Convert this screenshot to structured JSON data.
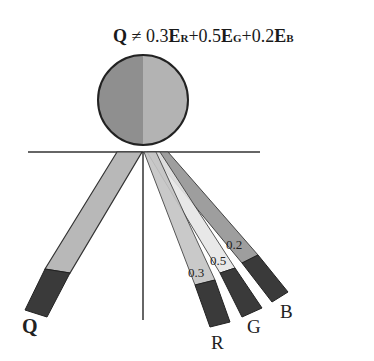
{
  "formula": {
    "lhs": "Q",
    "relation": "≠",
    "terms": [
      {
        "coef": "0.3",
        "symbol": "E",
        "subscript": "R"
      },
      {
        "coef": "0.5",
        "symbol": "E",
        "subscript": "G"
      },
      {
        "coef": "0.2",
        "symbol": "E",
        "subscript": "B"
      }
    ],
    "plus": "+"
  },
  "colors": {
    "circle_left": "#8f8f8f",
    "circle_right": "#b3b3b3",
    "stick_q": "#b8b8b8",
    "stick_r": "#c4c4c4",
    "stick_g": "#e6e6e6",
    "stick_b": "#9e9e9e",
    "tip": "#3a3a3a",
    "line": "#333333"
  },
  "sticks": {
    "q": {
      "label": "Q"
    },
    "r": {
      "label": "R",
      "weight": "0.3"
    },
    "g": {
      "label": "G",
      "weight": "0.5"
    },
    "b": {
      "label": "B",
      "weight": "0.2"
    }
  }
}
